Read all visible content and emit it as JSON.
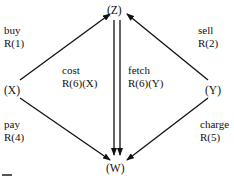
{
  "nodes": {
    "z": "(Z)",
    "x": "(X)",
    "y": "(Y)",
    "w": "(W)"
  },
  "edges": {
    "buy": {
      "name": "buy",
      "rule": "R(1)"
    },
    "sell": {
      "name": "sell",
      "rule": "R(2)"
    },
    "pay": {
      "name": "pay",
      "rule": "R(4)"
    },
    "charge": {
      "name": "charge",
      "rule": "R(5)"
    },
    "cost": {
      "name": "cost",
      "rule": "R(6)(X)"
    },
    "fetch": {
      "name": "fetch",
      "rule": "R(6)(Y)"
    }
  },
  "colors": {
    "ink": "#111111",
    "background": "#ffffff"
  }
}
